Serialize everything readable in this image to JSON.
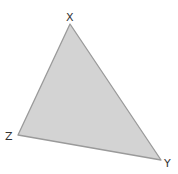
{
  "diagram": {
    "type": "triangle",
    "fill_color": "#d3d3d3",
    "stroke_color": "#9a9a9a",
    "vertices": [
      {
        "name": "X",
        "x": 70,
        "y": 24,
        "label_x": 66,
        "label_y": 21
      },
      {
        "name": "Y",
        "x": 161,
        "y": 160,
        "label_x": 164,
        "label_y": 167
      },
      {
        "name": "Z",
        "x": 18,
        "y": 135,
        "label_x": 5,
        "label_y": 140
      }
    ],
    "labels": {
      "x": "X",
      "y": "Y",
      "z": "Z"
    }
  }
}
